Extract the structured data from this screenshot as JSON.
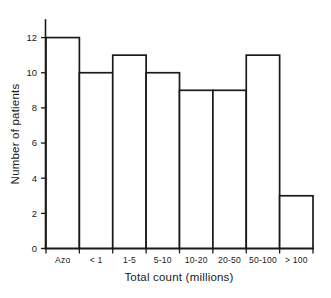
{
  "chart_data": {
    "type": "bar",
    "title": "",
    "categories": [
      "Azo",
      "< 1",
      "1-5",
      "5-10",
      "10-20",
      "20-50",
      "50-100",
      "> 100"
    ],
    "values": [
      12,
      10,
      11,
      10,
      9,
      9,
      11,
      3
    ],
    "xlabel": "Total count (millions)",
    "ylabel": "Number of patients",
    "ylim": [
      0,
      13
    ],
    "ytick_values": [
      0,
      2,
      4,
      6,
      8,
      10,
      12
    ],
    "ytick_labels": [
      "0",
      "2",
      "4",
      "6",
      "8",
      "10",
      "12"
    ],
    "grid": false,
    "legend": null,
    "style": {
      "bar_fill": "#ffffff",
      "bar_stroke": "#1a1a1a",
      "axis_color": "#1a1a1a",
      "background": "#ffffff"
    }
  }
}
